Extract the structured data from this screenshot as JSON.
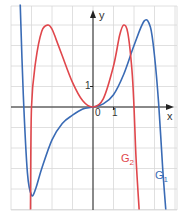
{
  "chart_data": {
    "type": "line",
    "title": "",
    "xlabel": "x",
    "ylabel": "y",
    "xlim": [
      -4,
      4
    ],
    "ylim": [
      -5,
      5
    ],
    "grid": true,
    "tick_labels": {
      "x": [
        "0",
        "1"
      ],
      "y": [
        "1"
      ]
    },
    "series": [
      {
        "name": "G1",
        "color": "#3a6bb5",
        "x": [
          -3.55,
          -3.4,
          -3.2,
          -3.0,
          -2.8,
          -2.5,
          -2.0,
          -1.5,
          -1.0,
          -0.5,
          0,
          0.5,
          1.0,
          1.5,
          2.0,
          2.5,
          2.8,
          3.0,
          3.2,
          3.4,
          3.55
        ],
        "y": [
          5.0,
          0.6,
          -3.2,
          -4.3,
          -4.0,
          -3.0,
          -1.6,
          -0.8,
          -0.4,
          -0.1,
          0,
          0.15,
          0.6,
          1.6,
          3.0,
          4.2,
          3.9,
          2.5,
          0.2,
          -3.0,
          -5.0
        ]
      },
      {
        "name": "G2",
        "color": "#e0474c",
        "x": [
          -3.05,
          -3.0,
          -2.8,
          -2.5,
          -2.2,
          -2.0,
          -1.8,
          -1.5,
          -1.0,
          -0.5,
          0,
          0.5,
          1.0,
          1.3,
          1.5,
          1.7,
          1.9,
          2.0,
          2.1,
          2.25
        ],
        "y": [
          -5.0,
          0,
          2.2,
          3.7,
          4.0,
          3.8,
          3.3,
          2.5,
          1.2,
          0.3,
          0,
          0.4,
          2.0,
          3.5,
          4.0,
          3.6,
          1.8,
          0,
          -2.5,
          -5.0
        ]
      }
    ],
    "annotations": [
      {
        "text": "G",
        "sub": "2",
        "series": "G2"
      },
      {
        "text": "G",
        "sub": "1",
        "series": "G1"
      }
    ]
  },
  "labels": {
    "x_axis": "x",
    "y_axis": "y",
    "origin": "0",
    "x_one": "1",
    "y_one": "1",
    "g1_main": "G",
    "g1_sub": "1",
    "g2_main": "G",
    "g2_sub": "2"
  }
}
